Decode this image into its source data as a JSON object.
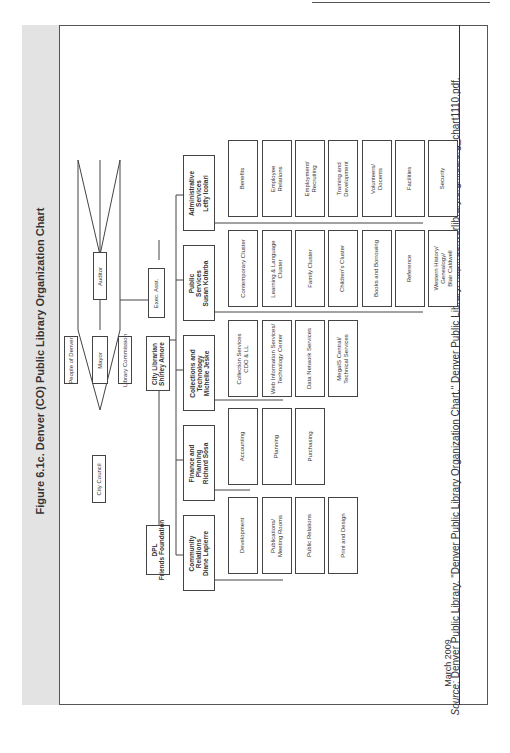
{
  "figure": {
    "title": "Figure 6.1c. Denver (CO) Public Library Organization Chart",
    "date": "March 2009",
    "source_label": "Source:",
    "source_text": "Denver Public Library. \"Denver Public Library Organization Chart.\" Denver Public Library. http://denverlibrary.org/files/org_chart1110.pdf."
  },
  "governance": {
    "people": "People of Denver",
    "mayor": "Mayor",
    "commission": "Library Commission",
    "council": "City Council",
    "auditor": "Auditor"
  },
  "leadership": {
    "city_librarian": "City Librarian\nShirley Amore",
    "exec_asst": "Exec. Asst.",
    "friends": "DPL\nFriends Foundation"
  },
  "departments": [
    {
      "name": "Administrative\nServices\nLetty Icolari",
      "units": [
        "Benefits",
        "Employee\nRelations",
        "Employment/\nRecruiting",
        "Training and\nDevelopment",
        "Volunteers/\nDocents",
        "Facilities",
        "Security"
      ]
    },
    {
      "name": "Public\nServices\nSusan Kotarba",
      "units": [
        "Contemporary Cluster",
        "Learning & Language\nCluster",
        "Family Cluster",
        "Children's Cluster",
        "Books and Borrowing",
        "Reference",
        "Western History/\nGenealogy/\nBlair Caldwell"
      ]
    },
    {
      "name": "Collections and\nTechnology\nMichelle Jeske",
      "units": [
        "Collection Services\nCDO & LL",
        "Web Information Services/\nTechnology Center",
        "Data Network Services",
        "MegaIS Central/\nTechnical Services"
      ]
    },
    {
      "name": "Finance and\nPlanning\nRichard Sosa",
      "units": [
        "Accounting",
        "Planning",
        "Purchasing"
      ]
    },
    {
      "name": "Community\nRelations\nDiane Lapierre",
      "units": [
        "Development",
        "Publications/\nMeeting Rooms",
        "Public Relations",
        "Print and Design"
      ]
    }
  ]
}
